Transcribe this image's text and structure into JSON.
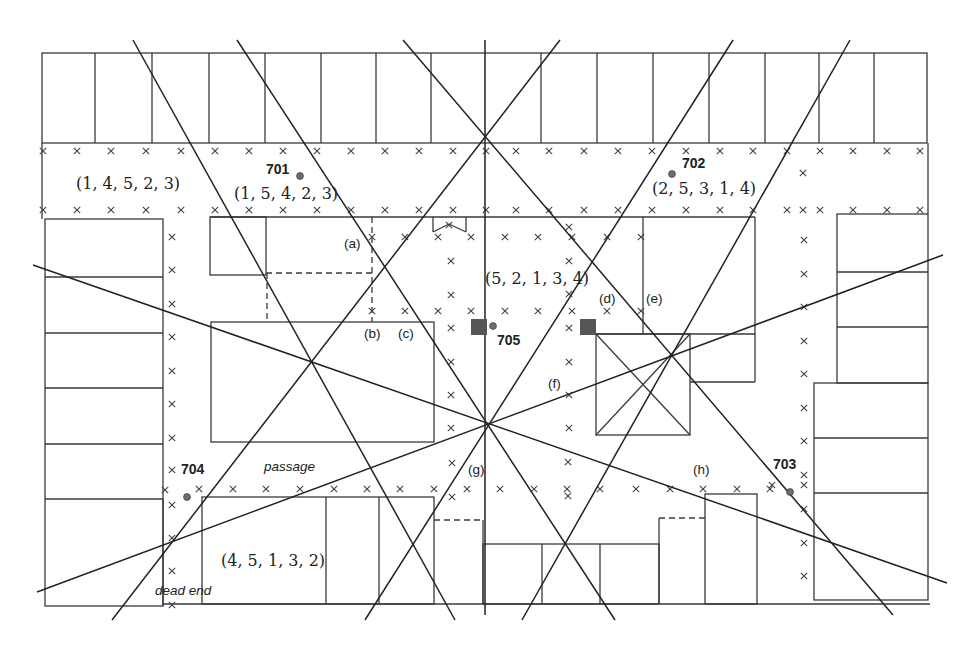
{
  "colors": {
    "background": "#ffffff",
    "building_stroke": "#3a3a3a",
    "viewpoint_dot": "#6e6e6e",
    "camera_square": "#555555"
  },
  "labels": [
    {
      "name": "tuple-label-street-top-left",
      "text": "(1, 4, 5, 2, 3)",
      "x": 76,
      "y": 189,
      "style": "tuple"
    },
    {
      "name": "viewpoint-701-label",
      "text": "701",
      "x": 266,
      "y": 174,
      "style": "vpid"
    },
    {
      "name": "tuple-label-701",
      "text": "(1, 5, 4, 2, 3)",
      "x": 234,
      "y": 199,
      "style": "tuple"
    },
    {
      "name": "viewpoint-702-label",
      "text": "702",
      "x": 682,
      "y": 168,
      "style": "vpid"
    },
    {
      "name": "tuple-label-702",
      "text": "(2, 5, 3, 1, 4)",
      "x": 652,
      "y": 194,
      "style": "tuple"
    },
    {
      "name": "marker-label-a",
      "text": "(a)",
      "x": 344,
      "y": 248,
      "style": "tag"
    },
    {
      "name": "tuple-label-courtyard",
      "text": "(5, 2, 1, 3, 4)",
      "x": 485,
      "y": 284,
      "style": "tuple"
    },
    {
      "name": "marker-label-b",
      "text": "(b)",
      "x": 364,
      "y": 338,
      "style": "tag"
    },
    {
      "name": "marker-label-c",
      "text": "(c)",
      "x": 398,
      "y": 338,
      "style": "tag"
    },
    {
      "name": "marker-label-d",
      "text": "(d)",
      "x": 599,
      "y": 303,
      "style": "tag"
    },
    {
      "name": "marker-label-e",
      "text": "(e)",
      "x": 646,
      "y": 303,
      "style": "tag"
    },
    {
      "name": "viewpoint-705-label",
      "text": "705",
      "x": 497,
      "y": 345,
      "style": "vpid"
    },
    {
      "name": "marker-label-f",
      "text": "(f)",
      "x": 548,
      "y": 388,
      "style": "tag"
    },
    {
      "name": "viewpoint-704-label",
      "text": "704",
      "x": 181,
      "y": 474,
      "style": "vpid"
    },
    {
      "name": "passage-label",
      "text": "passage",
      "x": 264,
      "y": 471,
      "style": "note"
    },
    {
      "name": "marker-label-g",
      "text": "(g)",
      "x": 468,
      "y": 474,
      "style": "tag"
    },
    {
      "name": "marker-label-h",
      "text": "(h)",
      "x": 693,
      "y": 474,
      "style": "tag"
    },
    {
      "name": "viewpoint-703-label",
      "text": "703",
      "x": 773,
      "y": 469,
      "style": "vpid"
    },
    {
      "name": "tuple-label-bottom-left",
      "text": "(4, 5, 1, 3, 2)",
      "x": 221,
      "y": 566,
      "style": "tuple"
    },
    {
      "name": "dead-end-label",
      "text": "dead end",
      "x": 155,
      "y": 595,
      "style": "note"
    }
  ],
  "viewpoints": [
    {
      "id": "701",
      "x": 300,
      "y": 176
    },
    {
      "id": "702",
      "x": 672,
      "y": 174
    },
    {
      "id": "703",
      "x": 790,
      "y": 492
    },
    {
      "id": "704",
      "x": 187,
      "y": 497
    },
    {
      "id": "705",
      "x": 493,
      "y": 326
    }
  ],
  "camera_squares": [
    {
      "x": 471,
      "y": 319,
      "size": 16
    },
    {
      "x": 580,
      "y": 319,
      "size": 16
    }
  ],
  "sight_lines": [
    [
      133,
      40,
      455,
      620
    ],
    [
      237,
      40,
      615,
      620
    ],
    [
      403,
      40,
      893,
      615
    ],
    [
      485,
      40,
      485,
      615
    ],
    [
      560,
      40,
      112,
      620
    ],
    [
      733,
      40,
      365,
      620
    ],
    [
      850,
      40,
      522,
      620
    ],
    [
      33,
      265,
      947,
      583
    ],
    [
      37,
      592,
      943,
      255
    ]
  ],
  "buildings": {
    "rects": [
      [
        42,
        53,
        885,
        90
      ],
      [
        45,
        219,
        118,
        387
      ],
      [
        210,
        217,
        56,
        58
      ],
      [
        211,
        322,
        223,
        120
      ],
      [
        596,
        334,
        94,
        101
      ],
      [
        837,
        214,
        91,
        169
      ],
      [
        814,
        383,
        114,
        217
      ],
      [
        202,
        497,
        232,
        107
      ],
      [
        483,
        544,
        176,
        60
      ],
      [
        705,
        494,
        52,
        110
      ]
    ],
    "lines": [
      [
        95,
        53,
        95,
        143
      ],
      [
        152,
        53,
        152,
        143
      ],
      [
        209,
        53,
        209,
        143
      ],
      [
        265,
        53,
        265,
        143
      ],
      [
        321,
        53,
        321,
        143
      ],
      [
        376,
        53,
        376,
        143
      ],
      [
        431,
        53,
        431,
        143
      ],
      [
        541,
        53,
        541,
        143
      ],
      [
        597,
        53,
        597,
        143
      ],
      [
        653,
        53,
        653,
        143
      ],
      [
        709,
        53,
        709,
        143
      ],
      [
        765,
        53,
        765,
        143
      ],
      [
        819,
        53,
        819,
        143
      ],
      [
        874,
        53,
        874,
        143
      ],
      [
        42,
        143,
        42,
        219
      ],
      [
        928,
        143,
        928,
        214
      ],
      [
        45,
        277,
        163,
        277
      ],
      [
        45,
        333,
        163,
        333
      ],
      [
        45,
        388,
        163,
        388
      ],
      [
        45,
        444,
        163,
        444
      ],
      [
        45,
        499,
        163,
        499
      ],
      [
        163,
        499,
        163,
        606
      ],
      [
        210,
        217,
        755,
        217
      ],
      [
        755,
        217,
        755,
        382
      ],
      [
        643,
        217,
        643,
        334
      ],
      [
        596,
        334,
        755,
        334
      ],
      [
        690,
        382,
        755,
        382
      ],
      [
        596,
        334,
        690,
        435
      ],
      [
        690,
        334,
        596,
        435
      ],
      [
        433,
        217,
        433,
        232
      ],
      [
        466,
        217,
        466,
        232
      ],
      [
        433,
        232,
        449,
        224
      ],
      [
        466,
        232,
        449,
        224
      ],
      [
        837,
        272,
        928,
        272
      ],
      [
        837,
        327,
        928,
        327
      ],
      [
        814,
        438,
        928,
        438
      ],
      [
        814,
        493,
        928,
        493
      ],
      [
        326,
        497,
        326,
        604
      ],
      [
        379,
        497,
        379,
        604
      ],
      [
        483,
        520,
        483,
        604
      ],
      [
        542,
        544,
        542,
        604
      ],
      [
        600,
        544,
        600,
        604
      ],
      [
        659,
        518,
        659,
        604
      ],
      [
        163,
        604,
        930,
        604
      ]
    ],
    "dashed": [
      [
        266,
        273,
        372,
        273
      ],
      [
        372,
        217,
        372,
        322
      ],
      [
        267,
        273,
        267,
        322
      ],
      [
        434,
        520,
        483,
        520
      ],
      [
        659,
        518,
        705,
        518
      ]
    ]
  },
  "markers": [
    [
      43,
      151
    ],
    [
      77,
      151
    ],
    [
      111,
      151
    ],
    [
      146,
      151
    ],
    [
      181,
      151
    ],
    [
      215,
      151
    ],
    [
      249,
      151
    ],
    [
      283,
      151
    ],
    [
      317,
      151
    ],
    [
      351,
      151
    ],
    [
      385,
      151
    ],
    [
      419,
      151
    ],
    [
      453,
      151
    ],
    [
      486,
      151
    ],
    [
      516,
      151
    ],
    [
      549,
      151
    ],
    [
      584,
      151
    ],
    [
      618,
      151
    ],
    [
      652,
      151
    ],
    [
      686,
      151
    ],
    [
      720,
      151
    ],
    [
      753,
      151
    ],
    [
      787,
      151
    ],
    [
      820,
      151
    ],
    [
      853,
      151
    ],
    [
      887,
      151
    ],
    [
      920,
      151
    ],
    [
      43,
      210
    ],
    [
      77,
      210
    ],
    [
      111,
      210
    ],
    [
      146,
      210
    ],
    [
      181,
      210
    ],
    [
      215,
      210
    ],
    [
      249,
      210
    ],
    [
      283,
      210
    ],
    [
      317,
      210
    ],
    [
      351,
      210
    ],
    [
      385,
      210
    ],
    [
      419,
      210
    ],
    [
      453,
      210
    ],
    [
      486,
      210
    ],
    [
      516,
      210
    ],
    [
      549,
      210
    ],
    [
      584,
      210
    ],
    [
      618,
      210
    ],
    [
      652,
      210
    ],
    [
      686,
      210
    ],
    [
      720,
      210
    ],
    [
      753,
      210
    ],
    [
      787,
      210
    ],
    [
      803,
      210
    ],
    [
      820,
      210
    ],
    [
      853,
      210
    ],
    [
      887,
      210
    ],
    [
      920,
      210
    ],
    [
      803,
      173
    ],
    [
      172,
      237
    ],
    [
      172,
      270
    ],
    [
      172,
      304
    ],
    [
      172,
      337
    ],
    [
      172,
      371
    ],
    [
      172,
      404
    ],
    [
      172,
      438
    ],
    [
      172,
      470
    ],
    [
      172,
      505
    ],
    [
      172,
      538
    ],
    [
      172,
      571
    ],
    [
      172,
      605
    ],
    [
      165,
      490
    ],
    [
      199,
      489
    ],
    [
      233,
      489
    ],
    [
      266,
      489
    ],
    [
      300,
      489
    ],
    [
      334,
      489
    ],
    [
      367,
      489
    ],
    [
      400,
      489
    ],
    [
      434,
      489
    ],
    [
      467,
      489
    ],
    [
      500,
      489
    ],
    [
      534,
      489
    ],
    [
      567,
      489
    ],
    [
      600,
      489
    ],
    [
      636,
      489
    ],
    [
      670,
      489
    ],
    [
      703,
      489
    ],
    [
      737,
      489
    ],
    [
      770,
      489
    ],
    [
      452,
      463
    ],
    [
      452,
      497
    ],
    [
      568,
      462
    ],
    [
      568,
      496
    ],
    [
      451,
      261
    ],
    [
      451,
      295
    ],
    [
      451,
      328
    ],
    [
      451,
      362
    ],
    [
      451,
      395
    ],
    [
      451,
      428
    ],
    [
      569,
      227
    ],
    [
      569,
      261
    ],
    [
      569,
      294
    ],
    [
      569,
      328
    ],
    [
      569,
      362
    ],
    [
      569,
      395
    ],
    [
      569,
      428
    ],
    [
      372,
      237
    ],
    [
      405,
      237
    ],
    [
      438,
      237
    ],
    [
      471,
      237
    ],
    [
      505,
      237
    ],
    [
      538,
      237
    ],
    [
      572,
      237
    ],
    [
      607,
      237
    ],
    [
      641,
      237
    ],
    [
      449,
      225
    ],
    [
      372,
      311
    ],
    [
      405,
      311
    ],
    [
      438,
      311
    ],
    [
      471,
      311
    ],
    [
      505,
      311
    ],
    [
      538,
      311
    ],
    [
      572,
      311
    ],
    [
      607,
      311
    ],
    [
      641,
      311
    ],
    [
      804,
      240
    ],
    [
      804,
      274
    ],
    [
      804,
      307
    ],
    [
      804,
      341
    ],
    [
      804,
      374
    ],
    [
      804,
      408
    ],
    [
      804,
      441
    ],
    [
      804,
      475
    ],
    [
      804,
      485
    ],
    [
      804,
      509
    ],
    [
      804,
      543
    ],
    [
      804,
      576
    ],
    [
      772,
      485
    ]
  ]
}
